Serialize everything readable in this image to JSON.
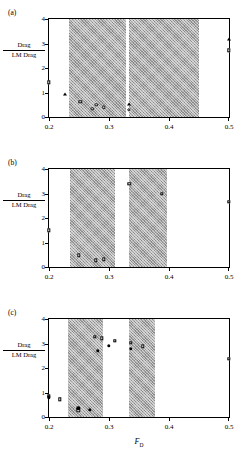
{
  "figure": {
    "ylabel_numerator": "Drag",
    "ylabel_denominator": "LM Drag",
    "xlabel_symbol": "F",
    "xlabel_subscript": "D",
    "panels": [
      {
        "id": "a",
        "label": "(a)"
      },
      {
        "id": "b",
        "label": "(b)"
      },
      {
        "id": "c",
        "label": "(c)"
      }
    ]
  },
  "chart_data": [
    {
      "type": "scatter",
      "title": "(a)",
      "xlabel": "",
      "ylabel": "Drag / LM Drag",
      "xlim": [
        0.2,
        0.5
      ],
      "ylim": [
        0,
        4
      ],
      "xticks": [
        0.2,
        0.3,
        0.4,
        0.5
      ],
      "xticklabels": [
        "0.2",
        "0.3",
        "0.4",
        "0.5"
      ],
      "yticks": [
        0,
        1,
        2,
        3,
        4
      ],
      "yticklabels": [
        "0",
        "1",
        "2",
        "3",
        "4"
      ],
      "grid": false,
      "legend": "none",
      "shaded_bands": [
        {
          "x0": 0.234,
          "x1": 0.328
        },
        {
          "x0": 0.334,
          "x1": 0.45
        }
      ],
      "series": [
        {
          "name": "open-square",
          "marker": "square-open",
          "points": [
            {
              "x": 0.2,
              "y": 1.42
            },
            {
              "x": 0.252,
              "y": 0.62
            },
            {
              "x": 0.5,
              "y": 2.72
            }
          ]
        },
        {
          "name": "open-circle",
          "marker": "circle-open",
          "points": [
            {
              "x": 0.272,
              "y": 0.34
            },
            {
              "x": 0.279,
              "y": 0.5
            },
            {
              "x": 0.291,
              "y": 0.4
            },
            {
              "x": 0.333,
              "y": 0.3
            }
          ]
        },
        {
          "name": "filled-triangle",
          "marker": "triangle-filled",
          "points": [
            {
              "x": 0.226,
              "y": 0.92
            },
            {
              "x": 0.333,
              "y": 0.52
            },
            {
              "x": 0.5,
              "y": 3.18
            }
          ]
        }
      ]
    },
    {
      "type": "scatter",
      "title": "(b)",
      "xlabel": "",
      "ylabel": "Drag / LM Drag",
      "xlim": [
        0.2,
        0.5
      ],
      "ylim": [
        0,
        4
      ],
      "xticks": [
        0.2,
        0.3,
        0.4,
        0.5
      ],
      "xticklabels": [
        "0.2",
        "0.3",
        "0.4",
        "0.5"
      ],
      "yticks": [
        0,
        1,
        2,
        3,
        4
      ],
      "yticklabels": [
        "0",
        "1",
        "2",
        "3",
        "4"
      ],
      "grid": false,
      "legend": "none",
      "shaded_bands": [
        {
          "x0": 0.235,
          "x1": 0.31
        },
        {
          "x0": 0.334,
          "x1": 0.396
        }
      ],
      "series": [
        {
          "name": "open-square",
          "marker": "square-open",
          "points": [
            {
              "x": 0.2,
              "y": 1.5
            },
            {
              "x": 0.25,
              "y": 0.47
            },
            {
              "x": 0.278,
              "y": 0.27
            },
            {
              "x": 0.291,
              "y": 0.31
            },
            {
              "x": 0.334,
              "y": 3.4
            },
            {
              "x": 0.388,
              "y": 2.98
            },
            {
              "x": 0.5,
              "y": 2.66
            }
          ]
        }
      ]
    },
    {
      "type": "scatter",
      "title": "(c)",
      "xlabel": "F_D",
      "ylabel": "Drag / LM Drag",
      "xlim": [
        0.2,
        0.5
      ],
      "ylim": [
        0,
        4
      ],
      "xticks": [
        0.2,
        0.3,
        0.4,
        0.5
      ],
      "xticklabels": [
        "0.2",
        "0.3",
        "0.4",
        "0.5"
      ],
      "yticks": [
        0,
        1,
        2,
        3,
        4
      ],
      "yticklabels": [
        "0",
        "1",
        "2",
        "3",
        "4"
      ],
      "grid": false,
      "legend": "none",
      "shaded_bands": [
        {
          "x0": 0.232,
          "x1": 0.29
        },
        {
          "x0": 0.334,
          "x1": 0.376
        }
      ],
      "series": [
        {
          "name": "open-square",
          "marker": "square-open",
          "points": [
            {
              "x": 0.2,
              "y": 0.86
            },
            {
              "x": 0.218,
              "y": 0.72
            },
            {
              "x": 0.249,
              "y": 0.28
            },
            {
              "x": 0.276,
              "y": 3.28
            },
            {
              "x": 0.288,
              "y": 3.22
            },
            {
              "x": 0.31,
              "y": 3.12
            },
            {
              "x": 0.336,
              "y": 3.04
            },
            {
              "x": 0.356,
              "y": 2.88
            },
            {
              "x": 0.5,
              "y": 2.38
            }
          ]
        },
        {
          "name": "filled-circle",
          "marker": "circle-filled",
          "points": [
            {
              "x": 0.2,
              "y": 0.8
            },
            {
              "x": 0.249,
              "y": 0.36
            },
            {
              "x": 0.268,
              "y": 0.3
            },
            {
              "x": 0.281,
              "y": 2.7
            },
            {
              "x": 0.3,
              "y": 2.9
            },
            {
              "x": 0.336,
              "y": 2.78
            }
          ]
        }
      ]
    }
  ]
}
